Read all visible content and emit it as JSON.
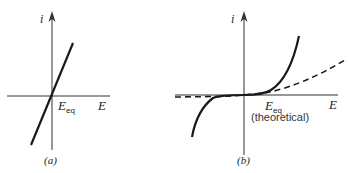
{
  "figure": {
    "panels": [
      {
        "id": "a",
        "caption": "(a)",
        "y_axis_label": "i",
        "x_axis_label": "E",
        "point_label_main": "E",
        "point_label_sub": "eq",
        "curve": "straight line through origin (ohmic, linear i–E)"
      },
      {
        "id": "b",
        "caption": "(b)",
        "y_axis_label": "i",
        "x_axis_label": "E",
        "point_label_main": "E",
        "point_label_sub": "eq",
        "point_note": "(theoretical)",
        "curves": [
          "solid: steep exponential rise both directions with flat plateau near zero current",
          "dashed: gentler curve crossing near origin"
        ]
      }
    ]
  },
  "colors": {
    "background": "#ffffff",
    "ink": "#1a1a1a"
  }
}
